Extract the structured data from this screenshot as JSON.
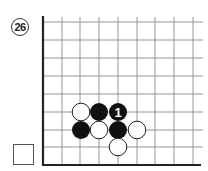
{
  "problem": {
    "number": "26",
    "number_icon": "circled-number-icon"
  },
  "board": {
    "edges": [
      "left",
      "bottom"
    ],
    "grid_color": "#888888",
    "edge_color": "#222222",
    "columns_x": [
      43,
      62,
      80,
      99,
      118,
      137,
      155,
      174,
      193
    ],
    "rows_y": [
      22,
      40,
      58,
      76,
      94,
      112,
      130,
      147,
      165
    ],
    "stones": [
      {
        "color": "white",
        "col": 2,
        "row": 5,
        "label": ""
      },
      {
        "color": "black",
        "col": 3,
        "row": 5,
        "label": ""
      },
      {
        "color": "black",
        "col": 4,
        "row": 5,
        "label": "1"
      },
      {
        "color": "black",
        "col": 2,
        "row": 6,
        "label": ""
      },
      {
        "color": "white",
        "col": 3,
        "row": 6,
        "label": ""
      },
      {
        "color": "black",
        "col": 4,
        "row": 6,
        "label": ""
      },
      {
        "color": "white",
        "col": 5,
        "row": 6,
        "label": ""
      },
      {
        "color": "white",
        "col": 4,
        "row": 7,
        "label": ""
      }
    ],
    "move_label": "1"
  },
  "answer_checkbox": {
    "checked": false
  }
}
